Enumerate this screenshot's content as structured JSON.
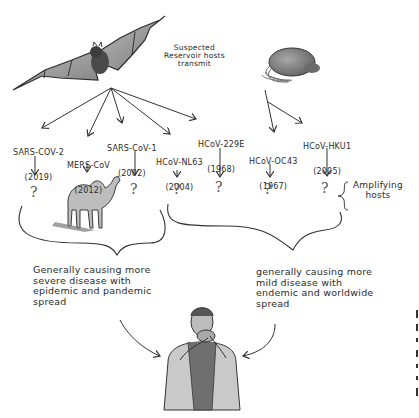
{
  "reservoir_label": "Suspected\nReservoir hosts\ntransmit",
  "reservoir_hosts": [
    {
      "name": "bat",
      "icon": "bat-icon"
    },
    {
      "name": "rat",
      "icon": "rat-icon"
    }
  ],
  "viruses": [
    {
      "name": "SARS-COV-2",
      "year": "(2019)",
      "reservoir": "bat"
    },
    {
      "name": "MERS-CoV",
      "year": "(2012)",
      "reservoir": "bat"
    },
    {
      "name": "SARS-CoV-1",
      "year": "(2002)",
      "reservoir": "bat"
    },
    {
      "name": "HCoV-NL63",
      "year": "(2004)",
      "reservoir": "bat"
    },
    {
      "name": "HCoV-229E",
      "year": "(1968)",
      "reservoir": "bat"
    },
    {
      "name": "HCoV-OC43",
      "year": "(1967)",
      "reservoir": "rat"
    },
    {
      "name": "HCoV-HKU1",
      "year": "(2005)",
      "reservoir": "rat"
    }
  ],
  "intermediate_hosts": {
    "unknown_marker": "?",
    "known": [
      {
        "virus": "MERS-CoV",
        "host": "camel",
        "icon": "camel-icon"
      }
    ],
    "label": "Amplifying\nhosts"
  },
  "groups": {
    "left": {
      "members": [
        "SARS-COV-2",
        "MERS-CoV",
        "SARS-CoV-1"
      ],
      "description": "Generally causing more\nsevere disease with\nepidemic and pandemic\nspread"
    },
    "right": {
      "members": [
        "HCoV-NL63",
        "HCoV-229E",
        "HCoV-OC43",
        "HCoV-HKU1"
      ],
      "description": "generally causing more\nmild disease with\nendemic and worldwide\nspread"
    }
  },
  "target_host": {
    "name": "human",
    "icon": "coughing-human-icon"
  },
  "colors": {
    "ink": "#2b2b2b",
    "background": "#ffffff",
    "shade": "#8a8a8a"
  }
}
